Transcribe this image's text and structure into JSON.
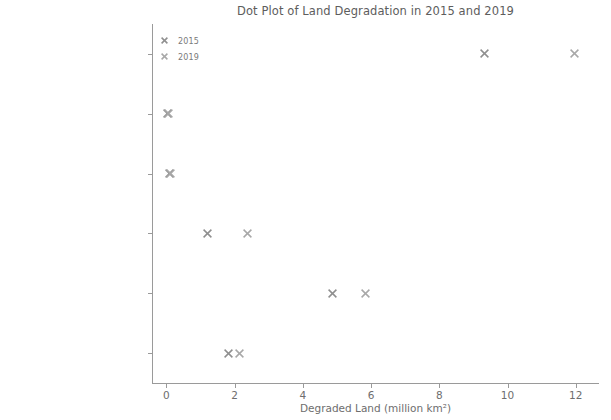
{
  "chart_data": {
    "type": "scatter",
    "title": "Dot Plot of Land Degradation in 2015 and 2019",
    "xlabel": "Degraded Land (million km²)",
    "ylabel": "",
    "xlim": [
      -0.42,
      12.68
    ],
    "xticks": [
      0,
      2,
      4,
      6,
      8,
      10,
      12
    ],
    "xticklabels": [
      "0",
      "2",
      "4",
      "6",
      "8",
      "10",
      "12"
    ],
    "categories": [
      "Global",
      "Central & Eastern Europe",
      "Northern Mediterranean",
      "Africa",
      "Asia",
      "Latin America & Caribbean"
    ],
    "grid": false,
    "legend_position": "upper left",
    "marker": "x",
    "series": [
      {
        "name": "2015",
        "color": "#8f8f8f",
        "values": [
          9.33,
          0.04,
          0.1,
          1.22,
          4.88,
          1.82
        ]
      },
      {
        "name": "2019",
        "color": "#a8a8a8",
        "values": [
          11.96,
          0.06,
          0.13,
          2.39,
          5.84,
          2.15
        ]
      }
    ]
  },
  "legend": {
    "entries": [
      {
        "label": "2015"
      },
      {
        "label": "2019"
      }
    ]
  },
  "colors": {
    "background": "#ffffff",
    "axis": "#9a9a9a",
    "text": "#6e6e6e",
    "series_2015": "#8f8f8f",
    "series_2019": "#a8a8a8"
  }
}
